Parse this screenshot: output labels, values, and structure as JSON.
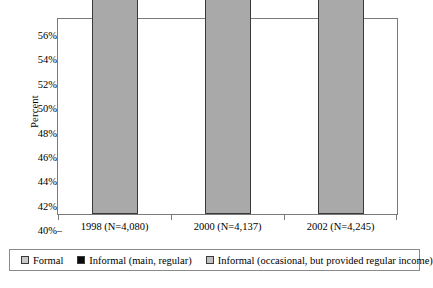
{
  "chart_data": {
    "type": "bar",
    "stacked": true,
    "title": "",
    "xlabel": "",
    "ylabel": "Percent",
    "ylim": [
      40,
      56
    ],
    "ytick_step": 2,
    "ytick_labels": [
      "56%",
      "54%",
      "52%",
      "50%",
      "48%",
      "46%",
      "44%",
      "42%",
      "40%"
    ],
    "ytick_values": [
      56,
      54,
      52,
      50,
      48,
      46,
      44,
      42,
      40
    ],
    "grid": false,
    "legend_position": "bottom",
    "categories": [
      "1998 (N=4,080)",
      "2000 (N=4,137)",
      "2002 (N=4,245)"
    ],
    "series": [
      {
        "name": "Informal (occasional, but provided regular income)",
        "color": "#a9a9a9",
        "values": [
          48.38,
          47.84,
          45.75
        ],
        "labels": [
          "48.38%",
          "47.84%",
          "45.75%"
        ]
      },
      {
        "name": "Informal (main, regular)",
        "color": "#0b0b0b",
        "values": [
          3.75,
          4.23,
          4.97
        ],
        "labels": [
          "3.75%",
          "4.23%",
          "4.97%"
        ]
      },
      {
        "name": "Formal",
        "color": "#c9c9c9",
        "values": [
          0.7,
          1.64,
          1.41
        ],
        "labels": [
          "0.7%",
          "1.64%",
          "1.41%"
        ]
      }
    ],
    "totals": [
      52.83,
      53.71,
      52.13
    ]
  },
  "legend": {
    "items": [
      {
        "label": "Formal",
        "icon": "legend-swatch-formal"
      },
      {
        "label": "Informal (main, regular)",
        "icon": "legend-swatch-informal-main"
      },
      {
        "label": "Informal (occasional, but provided regular income)",
        "icon": "legend-swatch-informal-occasional"
      }
    ]
  }
}
